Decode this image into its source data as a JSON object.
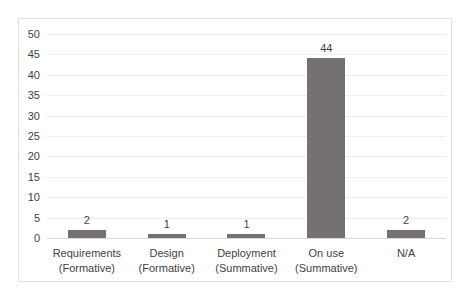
{
  "chart_data": {
    "type": "bar",
    "title": "",
    "subtitle": "",
    "xlabel": "",
    "ylabel": "",
    "categories": [
      "Requirements (Formative)",
      "Design (Formative)",
      "Deployment (Summative)",
      "On use (Summative)",
      "N/A"
    ],
    "category_lines": [
      [
        "Requirements",
        "(Formative)"
      ],
      [
        "Design",
        "(Formative)"
      ],
      [
        "Deployment",
        "(Summative)"
      ],
      [
        "On use",
        "(Summative)"
      ],
      [
        "N/A",
        ""
      ]
    ],
    "values": [
      2,
      1,
      1,
      44,
      2
    ],
    "data_labels": [
      "2",
      "1",
      "1",
      "44",
      "2"
    ],
    "ylim": [
      0,
      50
    ],
    "ytick_values": [
      0,
      5,
      10,
      15,
      20,
      25,
      30,
      35,
      40,
      45,
      50
    ],
    "ytick_labels": [
      "0",
      "5",
      "10",
      "15",
      "20",
      "25",
      "30",
      "35",
      "40",
      "45",
      "50"
    ],
    "grid": true,
    "legend": false,
    "legend_position": "none",
    "bar_color": "#767171",
    "gridline_color": "#ECEFF1",
    "axis_color": "#D9D9D9",
    "border_color": "#E2E2E2",
    "text_color": "#3F3F3F",
    "background_color": "#FFFFFF"
  }
}
